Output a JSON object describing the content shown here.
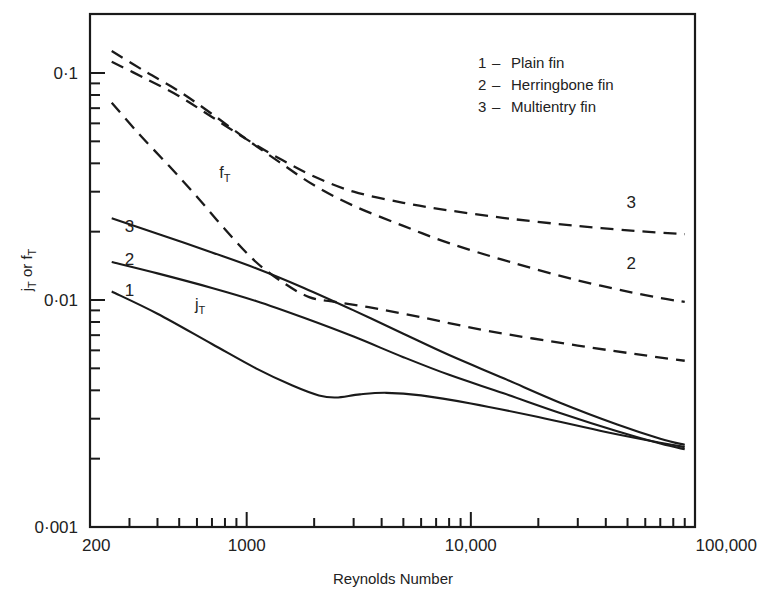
{
  "chart_data": {
    "type": "line",
    "title": "",
    "xlabel": "Reynolds Number",
    "ylabel": "jₜ or fₜ",
    "xscale": "log",
    "yscale": "log",
    "xlim": [
      200,
      100000
    ],
    "ylim": [
      0.001,
      0.2
    ],
    "grid": false,
    "legend_position": "top-right",
    "xticks_major": [
      {
        "value": 200,
        "label": "200"
      },
      {
        "value": 1000,
        "label": "1000"
      },
      {
        "value": 10000,
        "label": "10,000"
      },
      {
        "value": 100000,
        "label": "100,000"
      }
    ],
    "yticks_major": [
      {
        "value": 0.1,
        "label": "0·1"
      },
      {
        "value": 0.01,
        "label": "0·01"
      },
      {
        "value": 0.001,
        "label": "0·001"
      }
    ],
    "annotations": [
      {
        "text": "fₜ",
        "x": 800,
        "y": 0.0345,
        "name": "friction-factor-group-label"
      },
      {
        "text": "jₜ",
        "x": 620,
        "y": 0.009,
        "name": "colburn-factor-group-label"
      },
      {
        "text": "3",
        "x": 300,
        "y": 0.02,
        "name": "jt-curve-3-label"
      },
      {
        "text": "2",
        "x": 300,
        "y": 0.0143,
        "name": "jt-curve-2-label"
      },
      {
        "text": "1",
        "x": 300,
        "y": 0.0104,
        "name": "jt-curve-1-label"
      },
      {
        "text": "3",
        "x": 52000,
        "y": 0.0255,
        "name": "ft-curve-3-label"
      },
      {
        "text": "2",
        "x": 52000,
        "y": 0.0137,
        "name": "ft-curve-2-label"
      }
    ],
    "legend": [
      {
        "key": "1",
        "dash": "–",
        "label": "Plain fin"
      },
      {
        "key": "2",
        "dash": "–",
        "label": "Herringbone fin"
      },
      {
        "key": "3",
        "dash": "–",
        "label": "Multientry fin"
      }
    ],
    "series": [
      {
        "name": "f_T plain fin (1)",
        "style": "dashed",
        "points": [
          [
            250,
            0.074
          ],
          [
            330,
            0.054
          ],
          [
            450,
            0.039
          ],
          [
            600,
            0.0285
          ],
          [
            800,
            0.0205
          ],
          [
            1100,
            0.0147
          ],
          [
            1500,
            0.0117
          ],
          [
            1900,
            0.0103
          ],
          [
            2400,
            0.00985
          ],
          [
            3500,
            0.0093
          ],
          [
            6000,
            0.0084
          ],
          [
            12000,
            0.0073
          ],
          [
            30000,
            0.0063
          ],
          [
            60000,
            0.0057
          ],
          [
            90000,
            0.0054
          ]
        ]
      },
      {
        "name": "f_T herringbone fin (2)",
        "style": "dashed",
        "points": [
          [
            250,
            0.125
          ],
          [
            350,
            0.102
          ],
          [
            500,
            0.083
          ],
          [
            700,
            0.066
          ],
          [
            1000,
            0.051
          ],
          [
            1400,
            0.0405
          ],
          [
            2000,
            0.032
          ],
          [
            3000,
            0.026
          ],
          [
            5000,
            0.0212
          ],
          [
            8000,
            0.0178
          ],
          [
            15000,
            0.0147
          ],
          [
            30000,
            0.0122
          ],
          [
            60000,
            0.0105
          ],
          [
            90000,
            0.0098
          ]
        ]
      },
      {
        "name": "f_T multientry fin (3)",
        "style": "dashed",
        "points": [
          [
            250,
            0.112
          ],
          [
            350,
            0.095
          ],
          [
            500,
            0.079
          ],
          [
            700,
            0.064
          ],
          [
            1000,
            0.051
          ],
          [
            1400,
            0.042
          ],
          [
            2000,
            0.035
          ],
          [
            3000,
            0.03
          ],
          [
            5000,
            0.0268
          ],
          [
            8000,
            0.0248
          ],
          [
            15000,
            0.0228
          ],
          [
            30000,
            0.0212
          ],
          [
            60000,
            0.02
          ],
          [
            90000,
            0.0195
          ]
        ]
      },
      {
        "name": "j_T plain fin (1)",
        "style": "solid",
        "points": [
          [
            250,
            0.0109
          ],
          [
            400,
            0.0087
          ],
          [
            700,
            0.0064
          ],
          [
            1100,
            0.005
          ],
          [
            1600,
            0.0042
          ],
          [
            2100,
            0.0038
          ],
          [
            2500,
            0.00372
          ],
          [
            3200,
            0.00384
          ],
          [
            4200,
            0.0039
          ],
          [
            6000,
            0.0038
          ],
          [
            10000,
            0.0035
          ],
          [
            20000,
            0.00305
          ],
          [
            40000,
            0.00262
          ],
          [
            70000,
            0.00235
          ],
          [
            90000,
            0.00225
          ]
        ]
      },
      {
        "name": "j_T herringbone fin (2)",
        "style": "solid",
        "points": [
          [
            250,
            0.0147
          ],
          [
            400,
            0.0131
          ],
          [
            700,
            0.0113
          ],
          [
            1100,
            0.0099
          ],
          [
            1800,
            0.00835
          ],
          [
            3000,
            0.0069
          ],
          [
            5000,
            0.0056
          ],
          [
            8000,
            0.00468
          ],
          [
            14000,
            0.00388
          ],
          [
            25000,
            0.00318
          ],
          [
            45000,
            0.00264
          ],
          [
            70000,
            0.00233
          ],
          [
            90000,
            0.0022
          ]
        ]
      },
      {
        "name": "j_T multientry fin (3)",
        "style": "solid",
        "points": [
          [
            250,
            0.0229
          ],
          [
            400,
            0.0196
          ],
          [
            700,
            0.0162
          ],
          [
            1100,
            0.0138
          ],
          [
            1800,
            0.0113
          ],
          [
            3000,
            0.009
          ],
          [
            5000,
            0.0071
          ],
          [
            8000,
            0.00572
          ],
          [
            14000,
            0.00452
          ],
          [
            25000,
            0.00353
          ],
          [
            45000,
            0.00283
          ],
          [
            70000,
            0.00245
          ],
          [
            90000,
            0.0023
          ]
        ]
      }
    ]
  },
  "axis": {
    "x_title": "Reynolds Number",
    "y_title_parts": {
      "j": "j",
      "sub1": "T",
      "or": " or ",
      "f": "f",
      "sub2": "T"
    }
  }
}
